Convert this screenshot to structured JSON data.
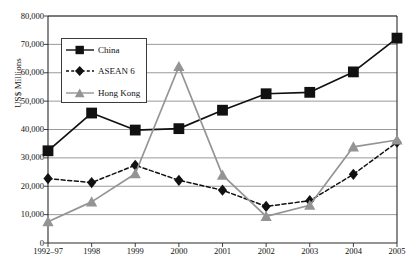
{
  "chart_data": {
    "type": "line",
    "title": "",
    "xlabel": "",
    "ylabel": "US$ Millions",
    "categories": [
      "1992–97",
      "1998",
      "1999",
      "2000",
      "2001",
      "2002",
      "2003",
      "2004",
      "2005"
    ],
    "ylim": [
      0,
      80000
    ],
    "ytick_labels": [
      "80,000",
      "70,000",
      "60,000",
      "50,000",
      "40,000",
      "30,000",
      "20,000",
      "10,000",
      "0"
    ],
    "ytick_values": [
      80000,
      70000,
      60000,
      50000,
      40000,
      30000,
      20000,
      10000,
      0
    ],
    "grid": true,
    "legend_position": "upper-left-inside",
    "series": [
      {
        "name": "China",
        "color": "#111111",
        "line_style": "solid",
        "marker": "square",
        "values": [
          32500,
          45800,
          39800,
          40300,
          46800,
          52600,
          53100,
          60300,
          72200
        ]
      },
      {
        "name": "ASEAN 6",
        "color": "#111111",
        "line_style": "dashed",
        "marker": "diamond",
        "values": [
          22700,
          21300,
          27400,
          22100,
          18600,
          12900,
          14900,
          24200,
          35500
        ]
      },
      {
        "name": "Hong Kong",
        "color": "#949494",
        "line_style": "solid",
        "marker": "triangle",
        "values": [
          7500,
          14500,
          24400,
          62200,
          23900,
          9400,
          13300,
          33900,
          36300
        ]
      }
    ]
  },
  "legend": {
    "items": [
      {
        "label": "China",
        "marker": "square-marker",
        "style": "solid",
        "color": "#111111"
      },
      {
        "label": "ASEAN 6",
        "marker": "diamond-marker",
        "style": "dashed",
        "color": "#111111"
      },
      {
        "label": "Hong Kong",
        "marker": "triangle-marker",
        "style": "solid",
        "color": "#949494"
      }
    ]
  },
  "axes": {
    "y_title": "US$ Millions"
  }
}
